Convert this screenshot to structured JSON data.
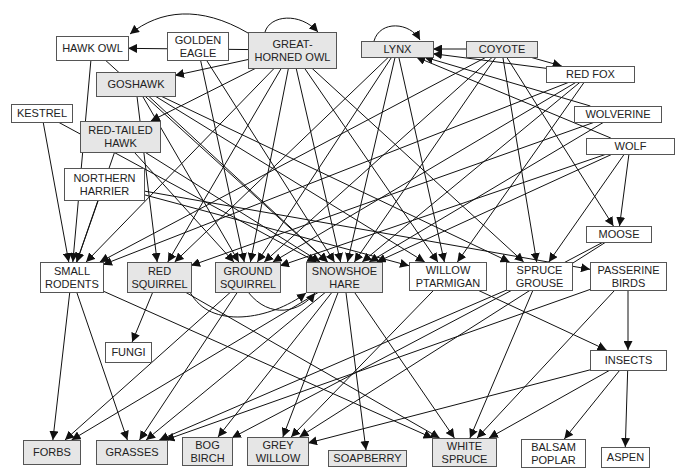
{
  "colors": {
    "shaded": "#e6e6e6",
    "plain": "#ffffff",
    "border": "#555555",
    "edge": "#111111"
  },
  "nodes": [
    {
      "id": "hawk_owl",
      "lines": [
        "HAWK OWL"
      ],
      "x": 56,
      "y": 36,
      "w": 72,
      "h": 24,
      "shaded": false
    },
    {
      "id": "golden_eagle",
      "lines": [
        "GOLDEN",
        "EAGLE"
      ],
      "x": 167,
      "y": 32,
      "w": 61,
      "h": 28,
      "shaded": false
    },
    {
      "id": "great_horned_owl",
      "lines": [
        "GREAT-",
        "HORNED OWL"
      ],
      "x": 248,
      "y": 32,
      "w": 88,
      "h": 36,
      "shaded": true
    },
    {
      "id": "lynx",
      "lines": [
        "LYNX"
      ],
      "x": 361,
      "y": 41,
      "w": 72,
      "h": 16,
      "shaded": true
    },
    {
      "id": "coyote",
      "lines": [
        "COYOTE"
      ],
      "x": 466,
      "y": 41,
      "w": 71,
      "h": 16,
      "shaded": true
    },
    {
      "id": "red_fox",
      "lines": [
        "RED FOX"
      ],
      "x": 546,
      "y": 66,
      "w": 88,
      "h": 16,
      "shaded": false
    },
    {
      "id": "goshawk",
      "lines": [
        "GOSHAWK"
      ],
      "x": 96,
      "y": 72,
      "w": 79,
      "h": 24,
      "shaded": true
    },
    {
      "id": "kestrel",
      "lines": [
        "KESTREL"
      ],
      "x": 11,
      "y": 104,
      "w": 61,
      "h": 18,
      "shaded": false
    },
    {
      "id": "wolverine",
      "lines": [
        "WOLVERINE"
      ],
      "x": 574,
      "y": 106,
      "w": 87,
      "h": 16,
      "shaded": false
    },
    {
      "id": "red_tailed_hawk",
      "lines": [
        "RED-TAILED",
        "HAWK"
      ],
      "x": 80,
      "y": 121,
      "w": 80,
      "h": 31,
      "shaded": true
    },
    {
      "id": "wolf",
      "lines": [
        "WOLF"
      ],
      "x": 586,
      "y": 138,
      "w": 88,
      "h": 16,
      "shaded": false
    },
    {
      "id": "northern_harrier",
      "lines": [
        "NORTHERN",
        "HARRIER"
      ],
      "x": 64,
      "y": 168,
      "w": 80,
      "h": 32,
      "shaded": false
    },
    {
      "id": "moose",
      "lines": [
        "MOOSE"
      ],
      "x": 586,
      "y": 226,
      "w": 65,
      "h": 16,
      "shaded": false
    },
    {
      "id": "small_rodents",
      "lines": [
        "SMALL",
        "RODENTS"
      ],
      "x": 40,
      "y": 262,
      "w": 63,
      "h": 30,
      "shaded": false
    },
    {
      "id": "red_squirrel",
      "lines": [
        "RED",
        "SQUIRREL"
      ],
      "x": 127,
      "y": 262,
      "w": 64,
      "h": 30,
      "shaded": true
    },
    {
      "id": "ground_squirrel",
      "lines": [
        "GROUND",
        "SQUIRREL"
      ],
      "x": 215,
      "y": 262,
      "w": 65,
      "h": 30,
      "shaded": true
    },
    {
      "id": "snowshoe_hare",
      "lines": [
        "SNOWSHOE",
        "HARE"
      ],
      "x": 306,
      "y": 262,
      "w": 76,
      "h": 30,
      "shaded": true
    },
    {
      "id": "willow_ptarmigan",
      "lines": [
        "WILLOW",
        "PTARMIGAN"
      ],
      "x": 409,
      "y": 262,
      "w": 77,
      "h": 28,
      "shaded": false
    },
    {
      "id": "spruce_grouse",
      "lines": [
        "SPRUCE",
        "GROUSE"
      ],
      "x": 506,
      "y": 262,
      "w": 66,
      "h": 28,
      "shaded": false
    },
    {
      "id": "passerine_birds",
      "lines": [
        "PASSERINE",
        "BIRDS"
      ],
      "x": 590,
      "y": 262,
      "w": 76,
      "h": 28,
      "shaded": false
    },
    {
      "id": "fungi",
      "lines": [
        "FUNGI"
      ],
      "x": 105,
      "y": 342,
      "w": 46,
      "h": 20,
      "shaded": false
    },
    {
      "id": "insects",
      "lines": [
        "INSECTS"
      ],
      "x": 590,
      "y": 350,
      "w": 76,
      "h": 20,
      "shaded": false
    },
    {
      "id": "forbs",
      "lines": [
        "FORBS"
      ],
      "x": 23,
      "y": 440,
      "w": 57,
      "h": 24,
      "shaded": true
    },
    {
      "id": "grasses",
      "lines": [
        "GRASSES"
      ],
      "x": 96,
      "y": 440,
      "w": 71,
      "h": 24,
      "shaded": true
    },
    {
      "id": "bog_birch",
      "lines": [
        "BOG",
        "BIRCH"
      ],
      "x": 182,
      "y": 437,
      "w": 50,
      "h": 28,
      "shaded": true
    },
    {
      "id": "grey_willow",
      "lines": [
        "GREY",
        "WILLOW"
      ],
      "x": 247,
      "y": 437,
      "w": 61,
      "h": 28,
      "shaded": true
    },
    {
      "id": "soapberry",
      "lines": [
        "SOAPBERRY"
      ],
      "x": 328,
      "y": 450,
      "w": 78,
      "h": 16,
      "shaded": true
    },
    {
      "id": "white_spruce",
      "lines": [
        "WHITE",
        "SPRUCE"
      ],
      "x": 432,
      "y": 438,
      "w": 64,
      "h": 28,
      "shaded": true
    },
    {
      "id": "balsam_poplar",
      "lines": [
        "BALSAM",
        "POPLAR"
      ],
      "x": 521,
      "y": 439,
      "w": 64,
      "h": 28,
      "shaded": false
    },
    {
      "id": "aspen",
      "lines": [
        "ASPEN"
      ],
      "x": 601,
      "y": 447,
      "w": 48,
      "h": 20,
      "shaded": false
    }
  ],
  "edges": [
    [
      "hawk_owl",
      "small_rodents"
    ],
    [
      "hawk_owl",
      "snowshoe_hare"
    ],
    [
      "golden_eagle",
      "ground_squirrel"
    ],
    [
      "golden_eagle",
      "snowshoe_hare"
    ],
    [
      "great_horned_owl",
      "hawk_owl"
    ],
    [
      "great_horned_owl",
      "goshawk"
    ],
    [
      "great_horned_owl",
      "red_tailed_hawk"
    ],
    [
      "great_horned_owl",
      "small_rodents"
    ],
    [
      "great_horned_owl",
      "red_squirrel"
    ],
    [
      "great_horned_owl",
      "ground_squirrel"
    ],
    [
      "great_horned_owl",
      "snowshoe_hare"
    ],
    [
      "great_horned_owl",
      "willow_ptarmigan"
    ],
    [
      "great_horned_owl",
      "spruce_grouse"
    ],
    [
      "goshawk",
      "red_squirrel"
    ],
    [
      "goshawk",
      "ground_squirrel"
    ],
    [
      "goshawk",
      "snowshoe_hare"
    ],
    [
      "goshawk",
      "willow_ptarmigan"
    ],
    [
      "goshawk",
      "spruce_grouse"
    ],
    [
      "kestrel",
      "small_rodents"
    ],
    [
      "kestrel",
      "snowshoe_hare"
    ],
    [
      "red_tailed_hawk",
      "small_rodents"
    ],
    [
      "red_tailed_hawk",
      "ground_squirrel"
    ],
    [
      "red_tailed_hawk",
      "snowshoe_hare"
    ],
    [
      "northern_harrier",
      "small_rodents"
    ],
    [
      "northern_harrier",
      "willow_ptarmigan"
    ],
    [
      "northern_harrier",
      "passerine_birds"
    ],
    [
      "coyote",
      "lynx"
    ],
    [
      "coyote",
      "red_fox"
    ],
    [
      "coyote",
      "small_rodents"
    ],
    [
      "coyote",
      "ground_squirrel"
    ],
    [
      "coyote",
      "snowshoe_hare"
    ],
    [
      "coyote",
      "spruce_grouse"
    ],
    [
      "coyote",
      "moose"
    ],
    [
      "lynx",
      "red_squirrel"
    ],
    [
      "lynx",
      "ground_squirrel"
    ],
    [
      "lynx",
      "snowshoe_hare"
    ],
    [
      "lynx",
      "willow_ptarmigan"
    ],
    [
      "red_fox",
      "lynx"
    ],
    [
      "red_fox",
      "small_rodents"
    ],
    [
      "red_fox",
      "snowshoe_hare"
    ],
    [
      "red_fox",
      "willow_ptarmigan"
    ],
    [
      "red_fox",
      "ground_squirrel"
    ],
    [
      "wolverine",
      "lynx"
    ],
    [
      "wolverine",
      "snowshoe_hare"
    ],
    [
      "wolverine",
      "red_squirrel"
    ],
    [
      "wolf",
      "lynx"
    ],
    [
      "wolf",
      "moose"
    ],
    [
      "wolf",
      "snowshoe_hare"
    ],
    [
      "wolf",
      "spruce_grouse"
    ],
    [
      "wolf",
      "ground_squirrel"
    ],
    [
      "small_rodents",
      "forbs"
    ],
    [
      "small_rodents",
      "grasses"
    ],
    [
      "small_rodents",
      "white_spruce"
    ],
    [
      "red_squirrel",
      "fungi"
    ],
    [
      "red_squirrel",
      "white_spruce"
    ],
    [
      "ground_squirrel",
      "forbs"
    ],
    [
      "ground_squirrel",
      "grasses"
    ],
    [
      "snowshoe_hare",
      "grasses"
    ],
    [
      "snowshoe_hare",
      "bog_birch"
    ],
    [
      "snowshoe_hare",
      "grey_willow"
    ],
    [
      "snowshoe_hare",
      "soapberry"
    ],
    [
      "snowshoe_hare",
      "white_spruce"
    ],
    [
      "snowshoe_hare",
      "forbs"
    ],
    [
      "willow_ptarmigan",
      "grey_willow"
    ],
    [
      "willow_ptarmigan",
      "insects"
    ],
    [
      "spruce_grouse",
      "white_spruce"
    ],
    [
      "spruce_grouse",
      "grasses"
    ],
    [
      "moose",
      "grey_willow"
    ],
    [
      "moose",
      "bog_birch"
    ],
    [
      "passerine_birds",
      "insects"
    ],
    [
      "passerine_birds",
      "grasses"
    ],
    [
      "passerine_birds",
      "white_spruce"
    ],
    [
      "insects",
      "white_spruce"
    ],
    [
      "insects",
      "balsam_poplar"
    ],
    [
      "insects",
      "aspen"
    ],
    [
      "insects",
      "grey_willow"
    ]
  ]
}
